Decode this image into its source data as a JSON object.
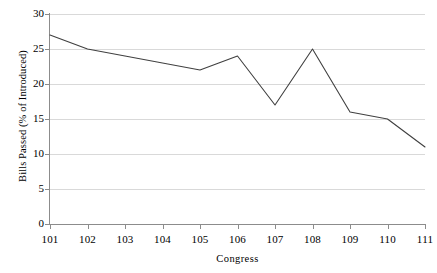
{
  "chart_data": {
    "type": "line",
    "title": "",
    "xlabel": "Congress",
    "ylabel": "Bills Passed (% of Introduced)",
    "categories": [
      "101",
      "102",
      "103",
      "104",
      "105",
      "106",
      "107",
      "108",
      "109",
      "110",
      "111"
    ],
    "values": [
      27,
      25,
      24,
      23,
      22,
      24,
      17,
      25,
      16,
      15,
      11
    ],
    "series": [
      {
        "name": "Bills Passed (% of Introduced)",
        "values": [
          27,
          25,
          24,
          23,
          22,
          24,
          17,
          25,
          16,
          15,
          11
        ]
      }
    ],
    "ylim": [
      0,
      30
    ],
    "yticks": [
      0,
      5,
      10,
      15,
      20,
      25,
      30
    ],
    "ytick_labels": [
      "0",
      "5",
      "10",
      "15",
      "20",
      "25",
      "30"
    ],
    "grid": "horizontal",
    "legend": "none",
    "line_color": "#404040",
    "gridline_color": "#d9d9d9",
    "axis_color": "#8c8c8c",
    "background_color": "#ffffff",
    "markers": "none"
  }
}
